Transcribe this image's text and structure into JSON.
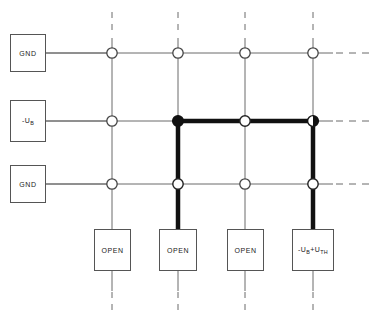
{
  "diagram": {
    "colors": {
      "background": "#ffffff",
      "thin_line": "#6b6b6b",
      "bold_line": "#111111",
      "box_border": "#555555",
      "node_fill_open": "#ffffff",
      "node_fill_closed": "#111111",
      "text": "#1a1a1a"
    },
    "grid": {
      "columns_x": [
        112,
        178,
        245,
        313
      ],
      "rows_y": [
        53,
        121,
        184
      ],
      "column_count": 4,
      "row_count": 3
    },
    "row_sources": [
      {
        "id": "row-1",
        "label": "GND",
        "label_html": "GND",
        "y": 53
      },
      {
        "id": "row-2",
        "label": "-U B",
        "label_html": "-U<sub>B</sub>",
        "y": 121
      },
      {
        "id": "row-3",
        "label": "GND",
        "label_html": "GND",
        "y": 184
      }
    ],
    "column_terminations": [
      {
        "id": "col-1",
        "label": "OPEN",
        "label_html": "OPEN",
        "x": 112,
        "state": "open"
      },
      {
        "id": "col-2",
        "label": "OPEN",
        "label_html": "OPEN",
        "x": 178,
        "state": "open"
      },
      {
        "id": "col-3",
        "label": "OPEN",
        "label_html": "OPEN",
        "x": 245,
        "state": "open"
      },
      {
        "id": "col-4",
        "label": "-U B + U TH",
        "label_html": "-U<sub>B</sub>+U<sub>TH</sub>",
        "x": 313,
        "state": "driven"
      }
    ],
    "nodes": [
      {
        "id": "node-r1c1",
        "row": 1,
        "col": 1,
        "x": 112,
        "y": 53,
        "state": "open"
      },
      {
        "id": "node-r1c2",
        "row": 1,
        "col": 2,
        "x": 178,
        "y": 53,
        "state": "open"
      },
      {
        "id": "node-r1c3",
        "row": 1,
        "col": 3,
        "x": 245,
        "y": 53,
        "state": "open"
      },
      {
        "id": "node-r1c4",
        "row": 1,
        "col": 4,
        "x": 313,
        "y": 53,
        "state": "open"
      },
      {
        "id": "node-r2c1",
        "row": 2,
        "col": 1,
        "x": 112,
        "y": 121,
        "state": "open"
      },
      {
        "id": "node-r2c2",
        "row": 2,
        "col": 2,
        "x": 178,
        "y": 121,
        "state": "closed"
      },
      {
        "id": "node-r2c3",
        "row": 2,
        "col": 3,
        "x": 245,
        "y": 121,
        "state": "open"
      },
      {
        "id": "node-r2c4",
        "row": 2,
        "col": 4,
        "x": 313,
        "y": 121,
        "state": "half"
      },
      {
        "id": "node-r3c1",
        "row": 3,
        "col": 1,
        "x": 112,
        "y": 184,
        "state": "open"
      },
      {
        "id": "node-r3c2",
        "row": 3,
        "col": 2,
        "x": 178,
        "y": 184,
        "state": "open"
      },
      {
        "id": "node-r3c3",
        "row": 3,
        "col": 3,
        "x": 245,
        "y": 184,
        "state": "open"
      },
      {
        "id": "node-r3c4",
        "row": 4,
        "col": 4,
        "x": 313,
        "y": 184,
        "state": "open"
      }
    ],
    "highlight_path": {
      "description": "Active signal path: row 2 from column 2 to column 4, down column 2 and column 4 to their termination boxes",
      "segments": [
        {
          "from_x": 178,
          "from_y": 121,
          "to_x": 313,
          "to_y": 121
        },
        {
          "from_x": 178,
          "from_y": 121,
          "to_x": 178,
          "to_y": 229
        },
        {
          "from_x": 313,
          "from_y": 121,
          "to_x": 313,
          "to_y": 229
        }
      ]
    }
  }
}
